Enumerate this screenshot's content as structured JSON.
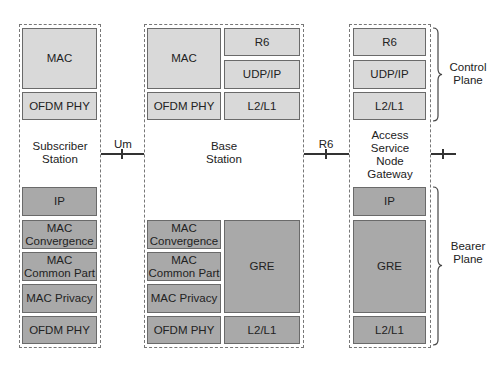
{
  "diagram": {
    "type": "protocol-stack",
    "colors": {
      "control_layer": "#d9d9d9",
      "bearer_layer": "#a9a9a9",
      "border": "#6a6a6a"
    },
    "stations": {
      "subscriber": {
        "name": "Subscriber\nStation",
        "control": [
          "MAC",
          "OFDM PHY"
        ],
        "bearer": [
          "IP",
          "MAC\nConvergence",
          "MAC\nCommon Part",
          "MAC Privacy",
          "OFDM PHY"
        ]
      },
      "base": {
        "name": "Base\nStation",
        "control_left": [
          "MAC",
          "OFDM PHY"
        ],
        "control_right": [
          "R6",
          "UDP/IP",
          "L2/L1"
        ],
        "bearer_left": [
          "MAC\nConvergence",
          "MAC\nCommon Part",
          "MAC Privacy",
          "OFDM PHY"
        ],
        "bearer_right": [
          "GRE",
          "L2/L1"
        ]
      },
      "asn_gateway": {
        "name": "Access\nService\nNode\nGateway",
        "control": [
          "R6",
          "UDP/IP",
          "L2/L1"
        ],
        "bearer": [
          "IP",
          "GRE",
          "L2/L1"
        ]
      }
    },
    "interfaces": {
      "um": "Um",
      "r6": "R6"
    },
    "planes": {
      "control": "Control\nPlane",
      "bearer": "Bearer\nPlane"
    }
  }
}
